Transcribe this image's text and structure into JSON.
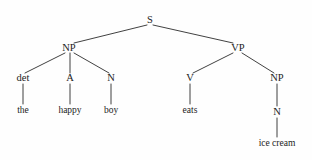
{
  "figure": {
    "kind": "constituency-parse-tree",
    "sentence": "the happy boy eats ice cream",
    "background_color": "#fefefe",
    "line_color": "#2b2b2b",
    "text_color": "#1c1c1c"
  },
  "nodes": {
    "s": {
      "label": "S",
      "x": 150,
      "y": 20
    },
    "np_subject": {
      "label": "NP",
      "x": 69,
      "y": 48
    },
    "vp": {
      "label": "VP",
      "x": 238,
      "y": 48
    },
    "det": {
      "label": "det",
      "x": 23,
      "y": 78
    },
    "adj": {
      "label": "A",
      "x": 70,
      "y": 78
    },
    "noun_subject": {
      "label": "N",
      "x": 111,
      "y": 78
    },
    "verb": {
      "label": "V",
      "x": 190,
      "y": 78
    },
    "np_object": {
      "label": "NP",
      "x": 277,
      "y": 78
    },
    "noun_object": {
      "label": "N",
      "x": 277,
      "y": 112
    }
  },
  "leaves": {
    "the": {
      "label": "the",
      "x": 23,
      "y": 110
    },
    "happy": {
      "label": "happy",
      "x": 70,
      "y": 110
    },
    "boy": {
      "label": "boy",
      "x": 111,
      "y": 110
    },
    "eats": {
      "label": "eats",
      "x": 190,
      "y": 110
    },
    "ice_cream": {
      "label": "ice cream",
      "x": 277,
      "y": 143
    }
  },
  "edges": [
    {
      "name": "s-to-np-subject",
      "x1": 147,
      "y1": 25,
      "x2": 74,
      "y2": 43
    },
    {
      "name": "s-to-vp",
      "x1": 153,
      "y1": 25,
      "x2": 233,
      "y2": 43
    },
    {
      "name": "np-subject-to-det",
      "x1": 65,
      "y1": 53,
      "x2": 25,
      "y2": 73
    },
    {
      "name": "np-subject-to-adj",
      "x1": 70,
      "y1": 53,
      "x2": 70,
      "y2": 73
    },
    {
      "name": "np-subject-to-noun",
      "x1": 74,
      "y1": 53,
      "x2": 109,
      "y2": 73
    },
    {
      "name": "vp-to-verb",
      "x1": 233,
      "y1": 53,
      "x2": 193,
      "y2": 73
    },
    {
      "name": "vp-to-np-object",
      "x1": 242,
      "y1": 53,
      "x2": 274,
      "y2": 73
    },
    {
      "name": "det-to-the",
      "x1": 23,
      "y1": 84,
      "x2": 23,
      "y2": 104
    },
    {
      "name": "adj-to-happy",
      "x1": 70,
      "y1": 84,
      "x2": 70,
      "y2": 104
    },
    {
      "name": "noun-to-boy",
      "x1": 111,
      "y1": 84,
      "x2": 111,
      "y2": 104
    },
    {
      "name": "verb-to-eats",
      "x1": 190,
      "y1": 84,
      "x2": 190,
      "y2": 104
    },
    {
      "name": "np-object-to-noun",
      "x1": 277,
      "y1": 84,
      "x2": 277,
      "y2": 106
    },
    {
      "name": "noun-object-to-ice-cream",
      "x1": 277,
      "y1": 118,
      "x2": 277,
      "y2": 137
    }
  ]
}
